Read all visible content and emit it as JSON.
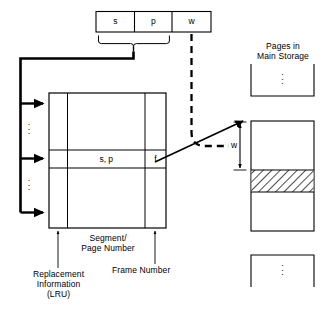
{
  "diagram": {
    "virtual_address": {
      "fields": [
        {
          "label": "s",
          "name": "segment-number-field"
        },
        {
          "label": "p",
          "name": "page-number-field"
        },
        {
          "label": "w",
          "name": "displacement-field"
        }
      ],
      "brace_covers": [
        "s",
        "p"
      ]
    },
    "table": {
      "name": "segment-page-table",
      "columns": [
        {
          "key": "replacement",
          "label": "Replacement\nInformation\n(LRU)"
        },
        {
          "key": "segment_page",
          "label": "Segment/\nPage Number"
        },
        {
          "key": "frame",
          "label": "Frame Number"
        }
      ],
      "highlighted_row": {
        "segment_page_value": "s, p",
        "frame_value": "f"
      },
      "row_dots": "⋮"
    },
    "main_storage": {
      "heading": "Pages in\nMain Storage",
      "dots": "⋮",
      "frame_box": {
        "name": "target-frame-box",
        "offset_label": "w",
        "hatched_band_name": "referenced-word-band"
      }
    },
    "arrows": {
      "brace_to_table": "solid",
      "displacement_to_frame": "dashed",
      "frame_number_to_storage": "solid"
    },
    "colors": {
      "line": "#000000",
      "background": "#ffffff",
      "hatch": "#000000"
    }
  }
}
